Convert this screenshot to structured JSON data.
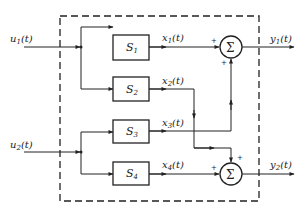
{
  "diagram": {
    "type": "block-diagram",
    "inputs": [
      {
        "id": "u1",
        "label": "u",
        "sub": "1",
        "arg": "(t)"
      },
      {
        "id": "u2",
        "label": "u",
        "sub": "2",
        "arg": "(t)"
      }
    ],
    "blocks": [
      {
        "id": "S1",
        "label": "S",
        "sub": "1"
      },
      {
        "id": "S2",
        "label": "S",
        "sub": "2"
      },
      {
        "id": "S3",
        "label": "S",
        "sub": "3"
      },
      {
        "id": "S4",
        "label": "S",
        "sub": "4"
      }
    ],
    "signals": [
      {
        "id": "x1",
        "label": "x",
        "sub": "1",
        "arg": "(t)"
      },
      {
        "id": "x2",
        "label": "x",
        "sub": "2",
        "arg": "(t)"
      },
      {
        "id": "x3",
        "label": "x",
        "sub": "3",
        "arg": "(t)"
      },
      {
        "id": "x4",
        "label": "x",
        "sub": "4",
        "arg": "(t)"
      }
    ],
    "summers": [
      {
        "id": "sum1",
        "symbol": "Σ",
        "signs": [
          "+",
          "+"
        ],
        "inputs": [
          "x1",
          "x3"
        ],
        "output": "y1"
      },
      {
        "id": "sum2",
        "symbol": "Σ",
        "signs": [
          "+",
          "+"
        ],
        "inputs": [
          "x2",
          "x4"
        ],
        "output": "y2"
      }
    ],
    "outputs": [
      {
        "id": "y1",
        "label": "y",
        "sub": "1",
        "arg": "(t)"
      },
      {
        "id": "y2",
        "label": "y",
        "sub": "2",
        "arg": "(t)"
      }
    ],
    "plus_sign": "+"
  }
}
